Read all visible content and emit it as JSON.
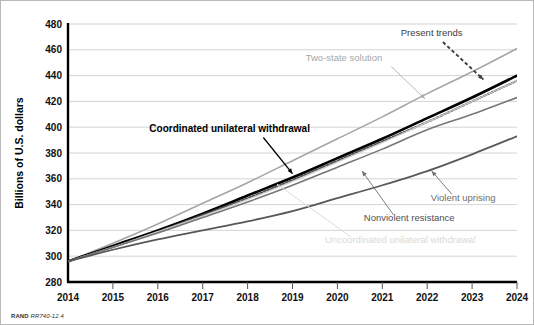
{
  "credit": {
    "org": "RAND",
    "id": "RR740-12.4"
  },
  "chart_data": {
    "type": "line",
    "title": "",
    "xlabel": "",
    "ylabel": "Billions of U.S. dollars",
    "xlim": [
      2014,
      2024
    ],
    "ylim": [
      280,
      480
    ],
    "ytick_step": 20,
    "grid": true,
    "legend": "inline-annotations",
    "categories": [
      2014,
      2015,
      2016,
      2017,
      2018,
      2019,
      2020,
      2021,
      2022,
      2023,
      2024
    ],
    "xticklabels": [
      "2014",
      "2015",
      "2016",
      "2017",
      "2018",
      "2019",
      "2020",
      "2021",
      "2022",
      "2023",
      "2024"
    ],
    "yticklabels": [
      "280",
      "300",
      "320",
      "340",
      "360",
      "380",
      "400",
      "420",
      "440",
      "460",
      "480"
    ],
    "series": [
      {
        "name": "Two-state solution",
        "color": "#a6a6a6",
        "width": 1.6,
        "dash": "none",
        "label_x": 2021.0,
        "label_y": 451,
        "label_anchor": "end",
        "values": [
          296,
          310,
          325,
          341,
          357,
          374,
          391,
          408,
          426,
          443,
          461
        ]
      },
      {
        "name": "Coordinated unilateral withdrawal",
        "color": "#000000",
        "width": 2.6,
        "dash": "none",
        "label_x": 2017.6,
        "label_y": 396,
        "label_anchor": "middle",
        "values": [
          296,
          308,
          320,
          333,
          347,
          361,
          376,
          391,
          407,
          423,
          440
        ]
      },
      {
        "name": "Present trends",
        "color": "#4d4d4d",
        "width": 2.0,
        "dash": "2,2",
        "label_x": 2022.1,
        "label_y": 471,
        "label_anchor": "middle",
        "values": [
          296,
          307,
          319,
          332,
          345,
          359,
          374,
          389,
          404,
          420,
          436
        ]
      },
      {
        "name": "Uncoordinated unilateral withdrawal",
        "color": "#cccccc",
        "width": 1.3,
        "dash": "none",
        "label_x": 2021.4,
        "label_y": 310,
        "label_anchor": "middle",
        "values": [
          296,
          307,
          319,
          331,
          344,
          358,
          373,
          388,
          404,
          420,
          436
        ]
      },
      {
        "name": "Nonviolent resistance",
        "color": "#767676",
        "width": 1.6,
        "dash": "none",
        "label_x": 2021.6,
        "label_y": 327,
        "label_anchor": "middle",
        "values": [
          296,
          307,
          318,
          330,
          342,
          355,
          369,
          383,
          398,
          410,
          423
        ]
      },
      {
        "name": "Violent uprising",
        "color": "#585858",
        "width": 1.8,
        "dash": "none",
        "label_x": 2022.8,
        "label_y": 343,
        "label_anchor": "middle",
        "values": [
          296,
          305,
          313,
          320,
          327,
          335,
          345,
          355,
          366,
          379,
          393
        ]
      }
    ],
    "annotations": [
      {
        "text": "Present trends",
        "color": "#404040",
        "bold": false,
        "arrow": "dashed"
      },
      {
        "text": "Two-state solution",
        "color": "#a6a6a6",
        "bold": false,
        "arrow": "thin"
      },
      {
        "text": "Coordinated unilateral withdrawal",
        "color": "#000000",
        "bold": true,
        "arrow": "solid"
      },
      {
        "text": "Violent uprising",
        "color": "#6e6e6e",
        "bold": false,
        "arrow": "thin"
      },
      {
        "text": "Nonviolent resistance",
        "color": "#555555",
        "bold": false,
        "arrow": "thin"
      },
      {
        "text": "Uncoordinated unilateral withdrawal",
        "color": "#d6d6d6",
        "bold": false,
        "arrow": "thin"
      }
    ]
  }
}
